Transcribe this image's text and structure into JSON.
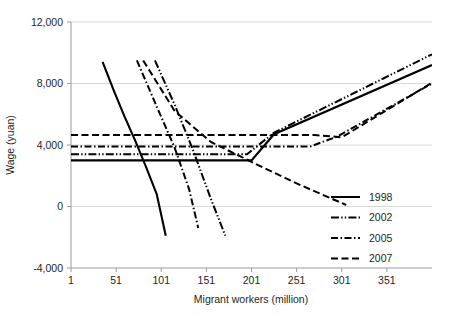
{
  "chart_data": {
    "type": "line",
    "title": "",
    "xlabel": "Migrant workers (million)",
    "ylabel": "Wage (yuan)",
    "xlim": [
      1,
      401
    ],
    "ylim": [
      -4000,
      12000
    ],
    "xticks": [
      1,
      51,
      101,
      151,
      201,
      251,
      301,
      351
    ],
    "xtick_labels": [
      "1",
      "51",
      "101",
      "151",
      "201",
      "251",
      "301",
      "351"
    ],
    "yticks": [
      -4000,
      0,
      4000,
      8000,
      12000
    ],
    "ytick_labels": [
      "-4,000",
      "0",
      "4,000",
      "8,000",
      "12,000"
    ],
    "grid": "horizontal",
    "legend_position": "lower-right",
    "legend_entries": [
      {
        "name": "1998",
        "style": "solid"
      },
      {
        "name": "2002",
        "style": "dash-dot-dot"
      },
      {
        "name": "2005",
        "style": "dash-dot"
      },
      {
        "name": "2007",
        "style": "dashed"
      }
    ],
    "series": [
      {
        "name": "1998",
        "role": "supply",
        "style": "solid",
        "points": [
          [
            1,
            3000
          ],
          [
            201,
            3000
          ],
          [
            226,
            4700
          ],
          [
            401,
            9200
          ]
        ]
      },
      {
        "name": "1998",
        "role": "demand",
        "style": "solid",
        "points": [
          [
            36,
            9400
          ],
          [
            48,
            7600
          ],
          [
            60,
            5900
          ],
          [
            72,
            4300
          ],
          [
            84,
            2600
          ],
          [
            96,
            800
          ],
          [
            106,
            -1900
          ]
        ]
      },
      {
        "name": "2002",
        "role": "supply",
        "style": "dash-dot-dot",
        "points": [
          [
            1,
            3400
          ],
          [
            196,
            3400
          ],
          [
            226,
            4800
          ],
          [
            401,
            9900
          ]
        ]
      },
      {
        "name": "2002",
        "role": "demand",
        "style": "dash-dot-dot",
        "points": [
          [
            94,
            9500
          ],
          [
            116,
            6600
          ],
          [
            136,
            3700
          ],
          [
            156,
            500
          ],
          [
            172,
            -1900
          ]
        ]
      },
      {
        "name": "2005",
        "role": "supply",
        "style": "dash-dot",
        "points": [
          [
            1,
            3900
          ],
          [
            266,
            3900
          ],
          [
            296,
            4550
          ],
          [
            401,
            8000
          ]
        ]
      },
      {
        "name": "2005",
        "role": "demand",
        "style": "dash-dot",
        "points": [
          [
            74,
            9500
          ],
          [
            96,
            6500
          ],
          [
            116,
            3800
          ],
          [
            132,
            1100
          ],
          [
            142,
            -1400
          ]
        ]
      },
      {
        "name": "2007",
        "role": "supply",
        "style": "dashed",
        "points": [
          [
            1,
            4650
          ],
          [
            271,
            4650
          ],
          [
            301,
            4500
          ],
          [
            401,
            8050
          ]
        ]
      },
      {
        "name": "2007",
        "role": "demand",
        "style": "dashed",
        "points": [
          [
            81,
            9500
          ],
          [
            116,
            6200
          ],
          [
            156,
            4200
          ],
          [
            201,
            2900
          ],
          [
            251,
            1500
          ],
          [
            306,
            100
          ]
        ]
      }
    ],
    "colors": {
      "line": "#000000",
      "axis": "#9b9b9b",
      "grid": "#d9d9d9",
      "text": "#231f20"
    }
  }
}
